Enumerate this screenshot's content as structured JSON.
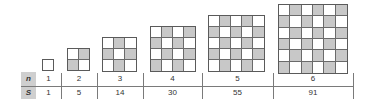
{
  "colors": {
    "shaded": "#c8c8c8",
    "unshaded": "#ffffff",
    "grid_line": "#6a6a6a",
    "label_bg": "#cfcfcf"
  },
  "table": {
    "row_labels": [
      "n",
      "S"
    ],
    "columns": [
      {
        "n": "1",
        "S": "1"
      },
      {
        "n": "2",
        "S": "5"
      },
      {
        "n": "3",
        "S": "14"
      },
      {
        "n": "4",
        "S": "30"
      },
      {
        "n": "5",
        "S": "55"
      },
      {
        "n": "6",
        "S": "91"
      }
    ]
  },
  "figures": [
    {
      "n": 1,
      "left": 42,
      "top": 59,
      "size": 12
    },
    {
      "n": 2,
      "left": 67,
      "top": 48,
      "size": 23
    },
    {
      "n": 3,
      "left": 102,
      "top": 37,
      "size": 35
    },
    {
      "n": 4,
      "left": 150,
      "top": 26,
      "size": 46
    },
    {
      "n": 5,
      "left": 208,
      "top": 15,
      "size": 57
    },
    {
      "n": 6,
      "left": 278,
      "top": 4,
      "size": 70
    }
  ],
  "column_bounds": [
    [
      36,
      61
    ],
    [
      61,
      97
    ],
    [
      97,
      143
    ],
    [
      143,
      202
    ],
    [
      202,
      273
    ],
    [
      273,
      353
    ]
  ]
}
